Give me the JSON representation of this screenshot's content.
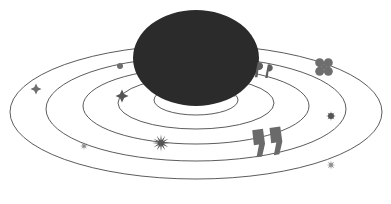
{
  "illustration": {
    "name": "speech-bubble-orbit-illustration",
    "width": 391,
    "height": 204,
    "background_color": "#ffffff",
    "description": "Dark speech bubble centered above a set of five concentric perspective ellipses (orbit rings) decorated with small star, sparkle, clover and quotation-mark glyphs.",
    "colors": {
      "bubble_fill": "#2b2b2b",
      "ring_stroke": "#4a4a4a",
      "marker_dark": "#555555",
      "marker_mid": "#6e6e6e",
      "marker_light": "#8a8a8a",
      "quote_large": "#6a6a6a",
      "quote_small": "#5f5f5f"
    }
  },
  "speech_bubble": {
    "label": "speech-bubble",
    "center_x": 196,
    "center_y": 58,
    "radius_x": 63,
    "radius_y": 48,
    "fill": "#2b2b2b",
    "tail": {
      "label": "speech-bubble-tail",
      "points": "222,92 236,97 212,83"
    }
  },
  "orbit_rings": [
    {
      "label": "orbit-ring-1",
      "cx": 196,
      "cy": 100,
      "rx": 42,
      "ry": 15,
      "stroke": "#4a4a4a",
      "stroke_width": 0.9
    },
    {
      "label": "orbit-ring-2",
      "cx": 196,
      "cy": 103,
      "rx": 78,
      "ry": 26,
      "stroke": "#4a4a4a",
      "stroke_width": 0.9
    },
    {
      "label": "orbit-ring-3",
      "cx": 196,
      "cy": 106,
      "rx": 113,
      "ry": 38,
      "stroke": "#4a4a4a",
      "stroke_width": 0.9
    },
    {
      "label": "orbit-ring-4",
      "cx": 196,
      "cy": 109,
      "rx": 150,
      "ry": 52,
      "stroke": "#4a4a4a",
      "stroke_width": 0.9
    },
    {
      "label": "orbit-ring-5",
      "cx": 196,
      "cy": 112,
      "rx": 186,
      "ry": 67,
      "stroke": "#4a4a4a",
      "stroke_width": 0.9
    }
  ],
  "markers": [
    {
      "label": "four-point-star-left-outer",
      "icon": "four-point-star-icon",
      "x": 36,
      "y": 89,
      "size": 11,
      "color": "#6e6e6e"
    },
    {
      "label": "sparkle-lower-left",
      "icon": "sparkle-icon",
      "x": 84,
      "y": 146,
      "size": 8,
      "color": "#8a8a8a"
    },
    {
      "label": "dot-upper-left",
      "icon": "dot-icon",
      "x": 120,
      "y": 66,
      "size": 6,
      "color": "#6e6e6e"
    },
    {
      "label": "four-point-sparkle-inner",
      "icon": "four-point-star-icon",
      "x": 122,
      "y": 96,
      "size": 13,
      "color": "#555555"
    },
    {
      "label": "starburst-bottom-center",
      "icon": "starburst-icon",
      "x": 161,
      "y": 143,
      "size": 17,
      "color": "#555555"
    },
    {
      "label": "quote-small-pair",
      "icon": "quote-mark-icon",
      "x": 266,
      "y": 71,
      "size": 17,
      "color": "#5f5f5f"
    },
    {
      "label": "clover-right-upper",
      "icon": "clover-icon",
      "x": 324,
      "y": 67,
      "size": 16,
      "color": "#6e6e6e"
    },
    {
      "label": "dot-star-right",
      "icon": "dot-star-icon",
      "x": 331,
      "y": 116,
      "size": 10,
      "color": "#555555"
    },
    {
      "label": "sparkle-bottom-right",
      "icon": "sparkle-icon",
      "x": 331,
      "y": 165,
      "size": 9,
      "color": "#8a8a8a"
    },
    {
      "label": "quote-large-pair",
      "icon": "quote-mark-large-icon",
      "x": 268,
      "y": 137,
      "size": 36,
      "color": "#6a6a6a"
    }
  ]
}
